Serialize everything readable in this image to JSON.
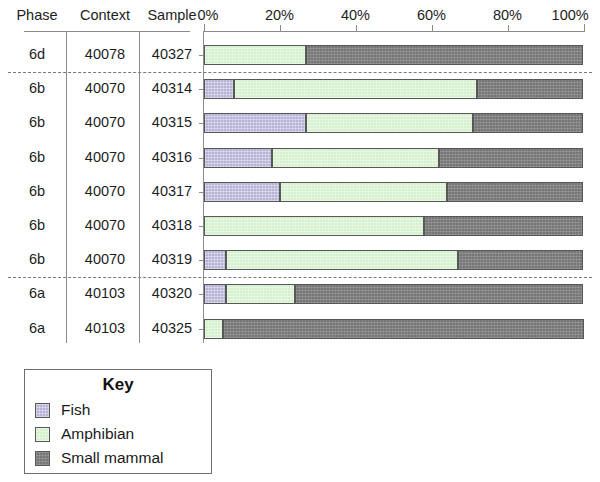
{
  "table": {
    "headers": {
      "phase": "Phase",
      "context": "Context",
      "sample": "Sample"
    }
  },
  "legend": {
    "title": "Key",
    "entries": [
      {
        "label": "Fish",
        "color": "#b6b3d6",
        "key": "fish"
      },
      {
        "label": "Amphibian",
        "color": "#d4f0cd",
        "key": "amphibian"
      },
      {
        "label": "Small mammal",
        "color": "#767676",
        "key": "small_mammal"
      }
    ]
  },
  "chart_data": {
    "type": "bar",
    "orientation": "horizontal",
    "stacked": true,
    "normalized": true,
    "title": "",
    "xlabel": "",
    "ylabel": "",
    "xlim": [
      0,
      100
    ],
    "grid": false,
    "legend_position": "bottom-left",
    "tick_labels": [
      "0%",
      "20%",
      "40%",
      "60%",
      "80%",
      "100%"
    ],
    "tick_values": [
      0,
      20,
      40,
      60,
      80,
      100
    ],
    "series": [
      {
        "name": "Fish",
        "color": "#b6b3d6",
        "values": [
          0,
          8,
          27,
          18,
          20,
          0,
          6,
          6,
          0
        ]
      },
      {
        "name": "Amphibian",
        "color": "#d4f0cd",
        "values": [
          27,
          64,
          44,
          44,
          44,
          58,
          61,
          18,
          5
        ]
      },
      {
        "name": "Small mammal",
        "color": "#767676",
        "values": [
          73,
          28,
          29,
          38,
          36,
          42,
          33,
          76,
          95
        ]
      }
    ],
    "categories": [
      "40327",
      "40314",
      "40315",
      "40316",
      "40317",
      "40318",
      "40319",
      "40320",
      "40325"
    ],
    "rows": [
      {
        "phase": "6d",
        "context": "40078",
        "sample": "40327",
        "fish": 0,
        "amphibian": 27,
        "small_mammal": 73
      },
      {
        "phase": "6b",
        "context": "40070",
        "sample": "40314",
        "fish": 8,
        "amphibian": 64,
        "small_mammal": 28
      },
      {
        "phase": "6b",
        "context": "40070",
        "sample": "40315",
        "fish": 27,
        "amphibian": 44,
        "small_mammal": 29
      },
      {
        "phase": "6b",
        "context": "40070",
        "sample": "40316",
        "fish": 18,
        "amphibian": 44,
        "small_mammal": 38
      },
      {
        "phase": "6b",
        "context": "40070",
        "sample": "40317",
        "fish": 20,
        "amphibian": 44,
        "small_mammal": 36
      },
      {
        "phase": "6b",
        "context": "40070",
        "sample": "40318",
        "fish": 0,
        "amphibian": 58,
        "small_mammal": 42
      },
      {
        "phase": "6b",
        "context": "40070",
        "sample": "40319",
        "fish": 6,
        "amphibian": 61,
        "small_mammal": 33
      },
      {
        "phase": "6a",
        "context": "40103",
        "sample": "40320",
        "fish": 6,
        "amphibian": 18,
        "small_mammal": 76
      },
      {
        "phase": "6a",
        "context": "40103",
        "sample": "40325",
        "fish": 0,
        "amphibian": 5,
        "small_mammal": 95
      }
    ],
    "phase_dividers_after_row": [
      0,
      6
    ]
  }
}
